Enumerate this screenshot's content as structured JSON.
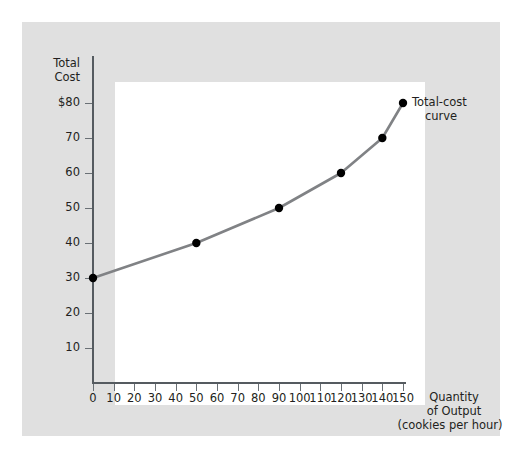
{
  "chart_data": {
    "type": "line",
    "title": "",
    "ylabel": "Total Cost",
    "xlabel": "Quantity of Output",
    "xlabel_sub": "(cookies per hour)",
    "series": [
      {
        "name": "Total-cost curve",
        "x": [
          0,
          50,
          90,
          120,
          140,
          150
        ],
        "values": [
          30,
          40,
          50,
          60,
          70,
          80
        ]
      }
    ],
    "x_ticks": [
      0,
      10,
      20,
      30,
      40,
      50,
      60,
      70,
      80,
      90,
      100,
      110,
      120,
      130,
      140,
      150
    ],
    "x_tick_labels": [
      "0",
      "10",
      "20",
      "30",
      "40",
      "50",
      "60",
      "70",
      "80",
      "90",
      "100",
      "110",
      "120",
      "130",
      "140",
      "150"
    ],
    "y_ticks": [
      10,
      20,
      30,
      40,
      50,
      60,
      70,
      80
    ],
    "y_tick_labels": [
      "10",
      "20",
      "30",
      "40",
      "50",
      "60",
      "70",
      "$80"
    ],
    "xlim": [
      0,
      150
    ],
    "ylim": [
      0,
      90
    ],
    "grid": false,
    "legend_position": "inline-annotation",
    "annotations": [
      {
        "text": "Total-cost curve",
        "line1": "Total-cost",
        "line2": "curve",
        "at_x": 150,
        "at_y": 80
      }
    ],
    "colors": {
      "curve": "#808285",
      "marker": "#000000",
      "axis": "#555b60",
      "panel_background": "#e0e0e0",
      "plot_background": "#ffffff",
      "text": "#231f20"
    }
  },
  "axis_titles": {
    "y_line1": "Total",
    "y_line2": "Cost",
    "x_line1": "Quantity",
    "x_line2": "of Output",
    "x_line3": "(cookies per hour)"
  }
}
